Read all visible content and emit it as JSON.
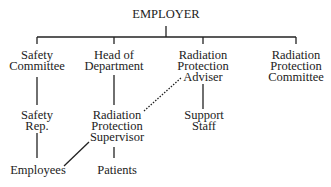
{
  "nodes": {
    "employer": "EMPLOYER",
    "safety_committee": [
      "Safety",
      "Committee"
    ],
    "head_of_department": [
      "Head of",
      "Department"
    ],
    "rpa": [
      "Radiation",
      "Protection",
      "Adviser"
    ],
    "rpc": [
      "Radiation",
      "Protection",
      "Committee"
    ],
    "safety_rep": [
      "Safety",
      "Rep."
    ],
    "rps": [
      "Radiation",
      "Protection",
      "Supervisor"
    ],
    "support_staff": [
      "Support",
      "Staff"
    ],
    "employees": "Employees",
    "patients": "Patients"
  }
}
